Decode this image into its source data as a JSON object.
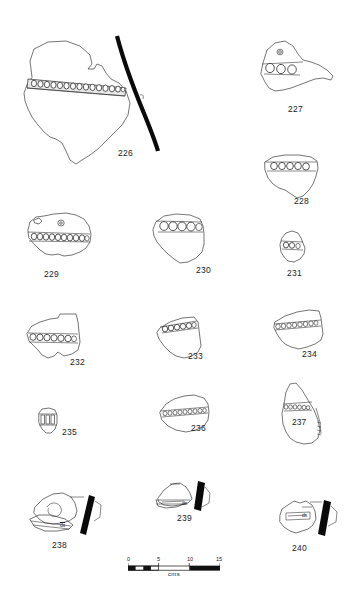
{
  "plate": {
    "title": "Archaeological illustration plate of decorated pottery sherds",
    "ink_color": "#3a3a3a",
    "profile_color": "#0a0a0a",
    "background": "#ffffff"
  },
  "scale": {
    "caption": "cms",
    "unit": "cm",
    "ticks": [
      "0",
      "5",
      "10",
      "15"
    ],
    "tick_values": [
      0,
      5,
      10,
      15
    ],
    "bar_length_px": 92
  },
  "annotations": {
    "ds_238": "ds",
    "ds_239": "ds",
    "ds_240": "ds"
  },
  "figures": [
    {
      "id": "226",
      "label": "226",
      "label_position": "below-right",
      "impression_count": 16,
      "has_profile": true,
      "description": "Large irregular body sherd with horizontal band of circular impressions"
    },
    {
      "id": "227",
      "label": "227",
      "label_position": "below",
      "impression_count": 3,
      "has_profile": false,
      "description": "Triangular sherd with three large circular impressions and one small boss"
    },
    {
      "id": "228",
      "label": "228",
      "label_position": "below-right",
      "impression_count": 5,
      "has_profile": false,
      "description": "Rim sherd with row of five circular impressions"
    },
    {
      "id": "229",
      "label": "229",
      "label_position": "below",
      "impression_count": 11,
      "has_profile": false,
      "description": "Sherd with long band of circular impressions and small boss above"
    },
    {
      "id": "230",
      "label": "230",
      "label_position": "below-right",
      "impression_count": 5,
      "has_profile": false,
      "description": "Rim sherd with band of five large circular impressions"
    },
    {
      "id": "231",
      "label": "231",
      "label_position": "below",
      "impression_count": 3,
      "has_profile": false,
      "description": "Small sherd with short band of impressions"
    },
    {
      "id": "232",
      "label": "232",
      "label_position": "below-right",
      "impression_count": 7,
      "has_profile": false,
      "description": "Angular sherd with horizontal band of circular impressions"
    },
    {
      "id": "233",
      "label": "233",
      "label_position": "below-right",
      "impression_count": 6,
      "has_profile": false,
      "description": "Sherd with oblique band of impressions along upper edge"
    },
    {
      "id": "234",
      "label": "234",
      "label_position": "below-right",
      "impression_count": 9,
      "has_profile": false,
      "description": "Sherd with dense band of small circular impressions"
    },
    {
      "id": "235",
      "label": "235",
      "label_position": "right",
      "impression_count": 3,
      "has_profile": false,
      "description": "Very small sherd with vertical incised bars"
    },
    {
      "id": "236",
      "label": "236",
      "label_position": "below-right",
      "impression_count": 10,
      "has_profile": false,
      "description": "Sherd with long horizontal band of small impressions"
    },
    {
      "id": "237",
      "label": "237",
      "label_position": "inside",
      "impression_count": 7,
      "has_profile": false,
      "description": "Tall wedge-shaped sherd with band of impressions and vertical edge detail"
    },
    {
      "id": "238",
      "label": "238",
      "label_position": "below",
      "impression_count": 0,
      "has_profile": true,
      "annotation": "ds",
      "description": "Sherd with spiral/arc motif, profile section and ds annotation"
    },
    {
      "id": "239",
      "label": "239",
      "label_position": "below",
      "impression_count": 0,
      "has_profile": true,
      "annotation": "ds",
      "description": "Small pointed sherd with profile section and ds annotation"
    },
    {
      "id": "240",
      "label": "240",
      "label_position": "below",
      "impression_count": 0,
      "has_profile": true,
      "annotation": "ds",
      "description": "Rounded sherd with incised rectangle, profile section and ds annotation"
    }
  ]
}
